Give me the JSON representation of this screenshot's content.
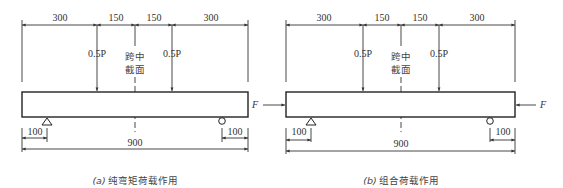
{
  "panels": [
    {
      "id": "a",
      "top_dims": [
        "300",
        "150",
        "150",
        "300"
      ],
      "load_left": "0.5P",
      "load_right": "0.5P",
      "mid_label_line1": "跨中",
      "mid_label_line2": "截面",
      "left_support_dim": "100",
      "right_support_dim": "100",
      "total_length": "900",
      "axial_force_left": "",
      "axial_force_right": "",
      "caption_tag": "(a)",
      "caption_text": "纯弯矩荷载作用"
    },
    {
      "id": "b",
      "top_dims": [
        "300",
        "150",
        "150",
        "300"
      ],
      "load_left": "0.5P",
      "load_right": "0.5P",
      "mid_label_line1": "跨中",
      "mid_label_line2": "截面",
      "left_support_dim": "100",
      "right_support_dim": "100",
      "total_length": "900",
      "axial_force_left": "F",
      "axial_force_right": "F",
      "caption_tag": "(b)",
      "caption_text": "组合荷载作用"
    }
  ]
}
